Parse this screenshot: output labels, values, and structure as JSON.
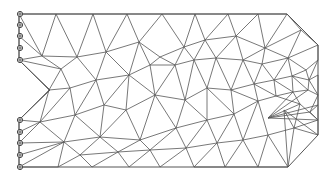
{
  "diagram": {
    "type": "finite-element-mesh",
    "colors": {
      "edge": "#555555",
      "support": "#444444",
      "background": "#ffffff"
    },
    "outline": [
      [
        19,
        14
      ],
      [
        287,
        14
      ],
      [
        318,
        45
      ],
      [
        318,
        135
      ],
      [
        288,
        167
      ],
      [
        19,
        167
      ],
      [
        19,
        120
      ],
      [
        50,
        90
      ],
      [
        19,
        60
      ]
    ],
    "supports": [
      {
        "x": 20,
        "y": 14
      },
      {
        "x": 20,
        "y": 25
      },
      {
        "x": 20,
        "y": 36
      },
      {
        "x": 20,
        "y": 48
      },
      {
        "x": 20,
        "y": 60
      },
      {
        "x": 20,
        "y": 120
      },
      {
        "x": 20,
        "y": 132
      },
      {
        "x": 20,
        "y": 143
      },
      {
        "x": 20,
        "y": 155
      },
      {
        "x": 20,
        "y": 167
      }
    ],
    "nodes": [
      [
        19,
        14
      ],
      [
        56,
        14
      ],
      [
        93,
        14
      ],
      [
        127,
        14
      ],
      [
        162,
        14
      ],
      [
        195,
        14
      ],
      [
        228,
        14
      ],
      [
        258,
        14
      ],
      [
        287,
        14
      ],
      [
        19,
        25
      ],
      [
        19,
        36
      ],
      [
        19,
        48
      ],
      [
        19,
        60
      ],
      [
        42,
        56
      ],
      [
        77,
        57
      ],
      [
        106,
        52
      ],
      [
        139,
        42
      ],
      [
        160,
        57
      ],
      [
        184,
        47
      ],
      [
        205,
        40
      ],
      [
        236,
        36
      ],
      [
        265,
        48
      ],
      [
        301,
        30
      ],
      [
        318,
        45
      ],
      [
        49,
        90
      ],
      [
        61,
        69
      ],
      [
        70,
        88
      ],
      [
        96,
        80
      ],
      [
        129,
        75
      ],
      [
        150,
        65
      ],
      [
        175,
        65
      ],
      [
        194,
        60
      ],
      [
        216,
        58
      ],
      [
        243,
        60
      ],
      [
        262,
        64
      ],
      [
        288,
        58
      ],
      [
        306,
        70
      ],
      [
        318,
        60
      ],
      [
        40,
        122
      ],
      [
        75,
        115
      ],
      [
        104,
        105
      ],
      [
        126,
        110
      ],
      [
        155,
        95
      ],
      [
        185,
        100
      ],
      [
        207,
        88
      ],
      [
        231,
        90
      ],
      [
        254,
        84
      ],
      [
        274,
        80
      ],
      [
        292,
        76
      ],
      [
        309,
        80
      ],
      [
        318,
        75
      ],
      [
        19,
        120
      ],
      [
        19,
        132
      ],
      [
        19,
        143
      ],
      [
        19,
        155
      ],
      [
        19,
        167
      ],
      [
        58,
        167
      ],
      [
        92,
        167
      ],
      [
        129,
        167
      ],
      [
        160,
        167
      ],
      [
        194,
        167
      ],
      [
        225,
        167
      ],
      [
        258,
        167
      ],
      [
        288,
        167
      ],
      [
        64,
        142
      ],
      [
        100,
        137
      ],
      [
        140,
        140
      ],
      [
        176,
        128
      ],
      [
        207,
        120
      ],
      [
        234,
        114
      ],
      [
        258,
        101
      ],
      [
        276,
        96
      ],
      [
        293,
        92
      ],
      [
        308,
        90
      ],
      [
        318,
        95
      ],
      [
        80,
        155
      ],
      [
        118,
        152
      ],
      [
        150,
        150
      ],
      [
        186,
        148
      ],
      [
        217,
        143
      ],
      [
        243,
        140
      ],
      [
        268,
        135
      ],
      [
        294,
        128
      ],
      [
        310,
        112
      ],
      [
        318,
        105
      ],
      [
        318,
        120
      ],
      [
        318,
        135
      ],
      [
        284,
        110
      ],
      [
        300,
        104
      ],
      [
        268,
        118
      ]
    ],
    "edges": [
      [
        0,
        1
      ],
      [
        1,
        2
      ],
      [
        2,
        3
      ],
      [
        3,
        4
      ],
      [
        4,
        5
      ],
      [
        5,
        6
      ],
      [
        6,
        7
      ],
      [
        7,
        8
      ],
      [
        8,
        22
      ],
      [
        22,
        23
      ],
      [
        0,
        9
      ],
      [
        9,
        10
      ],
      [
        10,
        11
      ],
      [
        11,
        12
      ],
      [
        0,
        13
      ],
      [
        10,
        13
      ],
      [
        12,
        13
      ],
      [
        13,
        1
      ],
      [
        13,
        14
      ],
      [
        1,
        14
      ],
      [
        14,
        2
      ],
      [
        2,
        15
      ],
      [
        14,
        15
      ],
      [
        15,
        3
      ],
      [
        15,
        16
      ],
      [
        3,
        16
      ],
      [
        16,
        4
      ],
      [
        16,
        17
      ],
      [
        4,
        18
      ],
      [
        17,
        18
      ],
      [
        18,
        5
      ],
      [
        18,
        19
      ],
      [
        5,
        19
      ],
      [
        19,
        6
      ],
      [
        19,
        20
      ],
      [
        6,
        20
      ],
      [
        20,
        7
      ],
      [
        20,
        21
      ],
      [
        7,
        21
      ],
      [
        21,
        8
      ],
      [
        21,
        22
      ],
      [
        22,
        35
      ],
      [
        21,
        35
      ],
      [
        35,
        23
      ],
      [
        35,
        36
      ],
      [
        36,
        37
      ],
      [
        37,
        23
      ],
      [
        12,
        25
      ],
      [
        13,
        25
      ],
      [
        25,
        14
      ],
      [
        25,
        26
      ],
      [
        12,
        24
      ],
      [
        24,
        25
      ],
      [
        24,
        26
      ],
      [
        26,
        27
      ],
      [
        14,
        27
      ],
      [
        27,
        15
      ],
      [
        27,
        28
      ],
      [
        15,
        28
      ],
      [
        28,
        16
      ],
      [
        28,
        29
      ],
      [
        16,
        29
      ],
      [
        29,
        17
      ],
      [
        29,
        30
      ],
      [
        17,
        30
      ],
      [
        30,
        18
      ],
      [
        30,
        31
      ],
      [
        18,
        31
      ],
      [
        31,
        19
      ],
      [
        31,
        32
      ],
      [
        19,
        32
      ],
      [
        32,
        20
      ],
      [
        32,
        33
      ],
      [
        20,
        33
      ],
      [
        33,
        21
      ],
      [
        33,
        34
      ],
      [
        21,
        34
      ],
      [
        34,
        35
      ],
      [
        34,
        47
      ],
      [
        35,
        47
      ],
      [
        35,
        48
      ],
      [
        36,
        48
      ],
      [
        36,
        49
      ],
      [
        37,
        49
      ],
      [
        49,
        50
      ],
      [
        48,
        49
      ],
      [
        24,
        38
      ],
      [
        26,
        38
      ],
      [
        26,
        39
      ],
      [
        38,
        39
      ],
      [
        27,
        39
      ],
      [
        27,
        40
      ],
      [
        39,
        40
      ],
      [
        28,
        40
      ],
      [
        40,
        41
      ],
      [
        28,
        41
      ],
      [
        41,
        42
      ],
      [
        28,
        42
      ],
      [
        29,
        42
      ],
      [
        42,
        43
      ],
      [
        30,
        43
      ],
      [
        30,
        42
      ],
      [
        43,
        31
      ],
      [
        43,
        44
      ],
      [
        31,
        44
      ],
      [
        44,
        32
      ],
      [
        44,
        45
      ],
      [
        32,
        45
      ],
      [
        45,
        33
      ],
      [
        45,
        46
      ],
      [
        33,
        46
      ],
      [
        46,
        34
      ],
      [
        46,
        47
      ],
      [
        47,
        48
      ],
      [
        24,
        51
      ],
      [
        51,
        38
      ],
      [
        51,
        52
      ],
      [
        52,
        53
      ],
      [
        53,
        54
      ],
      [
        54,
        55
      ],
      [
        38,
        52
      ],
      [
        38,
        53
      ],
      [
        38,
        64
      ],
      [
        53,
        64
      ],
      [
        54,
        64
      ],
      [
        55,
        64
      ],
      [
        55,
        56
      ],
      [
        64,
        56
      ],
      [
        64,
        75
      ],
      [
        56,
        75
      ],
      [
        75,
        57
      ],
      [
        64,
        65
      ],
      [
        65,
        75
      ],
      [
        39,
        64
      ],
      [
        39,
        65
      ],
      [
        40,
        65
      ],
      [
        41,
        65
      ],
      [
        65,
        76
      ],
      [
        75,
        76
      ],
      [
        76,
        57
      ],
      [
        76,
        58
      ],
      [
        65,
        66
      ],
      [
        41,
        66
      ],
      [
        66,
        76
      ],
      [
        66,
        77
      ],
      [
        76,
        77
      ],
      [
        77,
        58
      ],
      [
        77,
        59
      ],
      [
        42,
        66
      ],
      [
        42,
        67
      ],
      [
        66,
        67
      ],
      [
        67,
        77
      ],
      [
        67,
        78
      ],
      [
        77,
        78
      ],
      [
        78,
        59
      ],
      [
        78,
        60
      ],
      [
        43,
        67
      ],
      [
        43,
        68
      ],
      [
        67,
        68
      ],
      [
        68,
        78
      ],
      [
        68,
        79
      ],
      [
        78,
        79
      ],
      [
        79,
        60
      ],
      [
        79,
        61
      ],
      [
        44,
        68
      ],
      [
        44,
        69
      ],
      [
        68,
        69
      ],
      [
        69,
        79
      ],
      [
        69,
        80
      ],
      [
        79,
        80
      ],
      [
        80,
        61
      ],
      [
        80,
        62
      ],
      [
        45,
        69
      ],
      [
        45,
        70
      ],
      [
        69,
        70
      ],
      [
        70,
        80
      ],
      [
        70,
        81
      ],
      [
        80,
        81
      ],
      [
        81,
        62
      ],
      [
        81,
        63
      ],
      [
        46,
        70
      ],
      [
        46,
        71
      ],
      [
        70,
        71
      ],
      [
        47,
        71
      ],
      [
        47,
        72
      ],
      [
        71,
        72
      ],
      [
        48,
        72
      ],
      [
        48,
        73
      ],
      [
        72,
        73
      ],
      [
        49,
        73
      ],
      [
        49,
        74
      ],
      [
        73,
        74
      ],
      [
        50,
        74
      ],
      [
        60,
        61
      ],
      [
        61,
        62
      ],
      [
        62,
        63
      ],
      [
        63,
        87
      ],
      [
        87,
        86
      ],
      [
        86,
        85
      ],
      [
        85,
        84
      ],
      [
        84,
        74
      ],
      [
        70,
        90
      ],
      [
        71,
        90
      ],
      [
        81,
        90
      ],
      [
        90,
        88
      ],
      [
        72,
        88
      ],
      [
        71,
        88
      ],
      [
        88,
        89
      ],
      [
        73,
        89
      ],
      [
        72,
        89
      ],
      [
        89,
        83
      ],
      [
        74,
        83
      ],
      [
        83,
        84
      ],
      [
        89,
        84
      ],
      [
        88,
        82
      ],
      [
        90,
        82
      ],
      [
        81,
        82
      ],
      [
        82,
        63
      ],
      [
        82,
        87
      ],
      [
        82,
        86
      ],
      [
        83,
        85
      ],
      [
        82,
        85
      ],
      [
        89,
        85
      ],
      [
        88,
        85
      ]
    ]
  }
}
